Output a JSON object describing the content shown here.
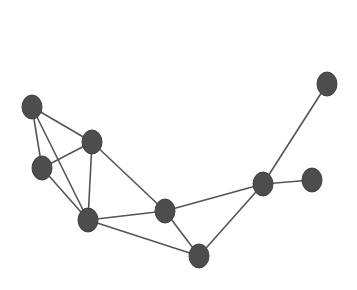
{
  "graph": {
    "node_color": "#4d4d4d",
    "edge_color": "#555555",
    "nodes": [
      {
        "id": "A",
        "x": 32,
        "y": 107
      },
      {
        "id": "B",
        "x": 92,
        "y": 142
      },
      {
        "id": "C",
        "x": 42,
        "y": 168
      },
      {
        "id": "D",
        "x": 88,
        "y": 220
      },
      {
        "id": "E",
        "x": 165,
        "y": 211
      },
      {
        "id": "F",
        "x": 327,
        "y": 84
      },
      {
        "id": "G",
        "x": 263,
        "y": 184
      },
      {
        "id": "H",
        "x": 312,
        "y": 180
      },
      {
        "id": "I",
        "x": 199,
        "y": 256
      }
    ],
    "edges": [
      [
        "A",
        "B"
      ],
      [
        "A",
        "C"
      ],
      [
        "A",
        "D"
      ],
      [
        "C",
        "B"
      ],
      [
        "C",
        "D"
      ],
      [
        "B",
        "D"
      ],
      [
        "B",
        "E"
      ],
      [
        "D",
        "E"
      ],
      [
        "D",
        "I"
      ],
      [
        "E",
        "I"
      ],
      [
        "E",
        "G"
      ],
      [
        "I",
        "G"
      ],
      [
        "G",
        "F"
      ],
      [
        "G",
        "H"
      ]
    ]
  }
}
